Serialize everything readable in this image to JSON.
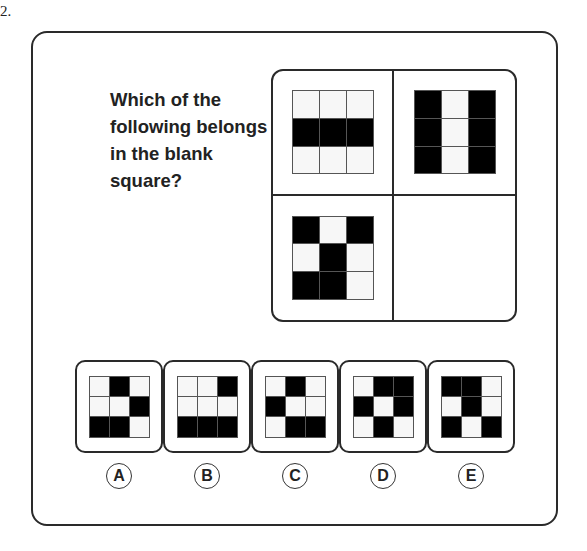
{
  "question_number": "2.",
  "question_text": "Which of the following belongs in the blank square?",
  "matrix": {
    "cells": [
      {
        "position": "top-left",
        "pattern": [
          [
            0,
            0,
            0
          ],
          [
            1,
            1,
            1
          ],
          [
            0,
            0,
            0
          ]
        ]
      },
      {
        "position": "top-right",
        "pattern": [
          [
            1,
            0,
            1
          ],
          [
            1,
            0,
            1
          ],
          [
            1,
            0,
            1
          ]
        ]
      },
      {
        "position": "bottom-left",
        "pattern": [
          [
            1,
            0,
            1
          ],
          [
            0,
            1,
            0
          ],
          [
            1,
            1,
            0
          ]
        ]
      },
      {
        "position": "bottom-right",
        "pattern": null,
        "blank": true
      }
    ]
  },
  "options": [
    {
      "label": "A",
      "pattern": [
        [
          0,
          1,
          0
        ],
        [
          0,
          0,
          1
        ],
        [
          1,
          1,
          0
        ]
      ]
    },
    {
      "label": "B",
      "pattern": [
        [
          0,
          0,
          1
        ],
        [
          0,
          0,
          0
        ],
        [
          1,
          1,
          1
        ]
      ]
    },
    {
      "label": "C",
      "pattern": [
        [
          0,
          1,
          0
        ],
        [
          1,
          0,
          0
        ],
        [
          0,
          1,
          1
        ]
      ]
    },
    {
      "label": "D",
      "pattern": [
        [
          0,
          1,
          1
        ],
        [
          1,
          0,
          1
        ],
        [
          0,
          1,
          0
        ]
      ]
    },
    {
      "label": "E",
      "pattern": [
        [
          1,
          1,
          0
        ],
        [
          0,
          1,
          0
        ],
        [
          1,
          0,
          1
        ]
      ]
    }
  ],
  "colors": {
    "filled": "#000000",
    "empty": "#f7f7f7",
    "border": "#2a2a2a"
  }
}
